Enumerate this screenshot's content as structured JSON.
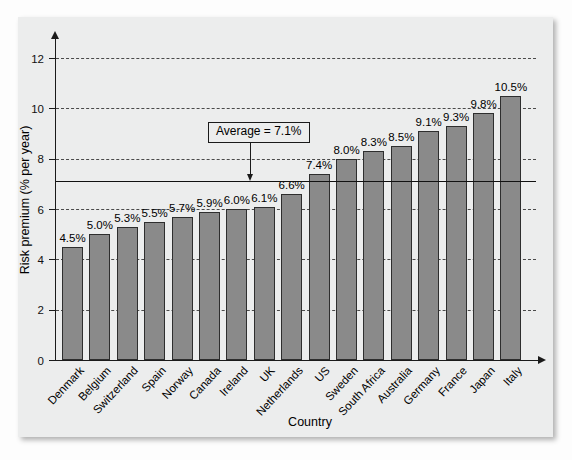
{
  "figure": {
    "panel_color": "#eceded",
    "bar_color": "#8a8a8a",
    "bar_border_color": "#2e2e2e",
    "axis_color": "#1a1a1a"
  },
  "chart_data": {
    "type": "bar",
    "title": "",
    "xlabel": "Country",
    "ylabel": "Risk premium (% per year)",
    "categories": [
      "Denmark",
      "Belgium",
      "Switzerland",
      "Spain",
      "Norway",
      "Canada",
      "Ireland",
      "UK",
      "Netherlands",
      "US",
      "Sweden",
      "South Africa",
      "Australia",
      "Germany",
      "France",
      "Japan",
      "Italy"
    ],
    "values": [
      4.5,
      5.0,
      5.3,
      5.5,
      5.7,
      5.9,
      6.0,
      6.1,
      6.6,
      7.4,
      8.0,
      8.3,
      8.5,
      9.1,
      9.3,
      9.8,
      10.5
    ],
    "value_labels": [
      "4.5%",
      "5.0%",
      "5.3%",
      "5.5%",
      "5.7%",
      "5.9%",
      "6.0%",
      "6.1%",
      "6.6%",
      "7.4%",
      "8.0%",
      "8.3%",
      "8.5%",
      "9.1%",
      "9.3%",
      "9.8%",
      "10.5%"
    ],
    "ylim": [
      0,
      12.8
    ],
    "yticks": [
      0,
      2,
      4,
      6,
      8,
      10,
      12
    ],
    "ytick_labels": [
      "0",
      "2",
      "4",
      "6",
      "8",
      "10",
      "12"
    ],
    "gridlines": [
      2,
      4,
      6,
      8,
      10,
      12
    ],
    "grid": true,
    "legend": null,
    "annotations": [
      {
        "name": "average-line",
        "label": "Average = 7.1%",
        "value": 7.1,
        "style": "solid-reference-line-with-callout"
      }
    ]
  }
}
